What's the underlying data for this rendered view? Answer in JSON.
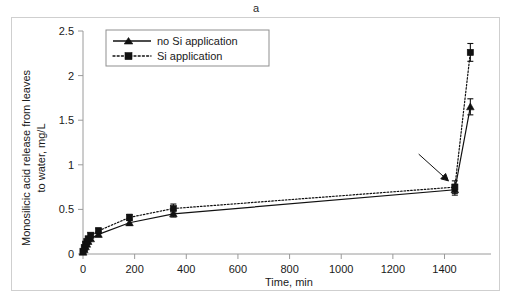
{
  "figure": {
    "panel_label": "a",
    "background_color": "#ffffff",
    "frame_color": "#cfcfcf",
    "ink_color": "#111111"
  },
  "chart_data": {
    "type": "line",
    "title": "a",
    "xlabel": "Time, min",
    "ylabel": "Monosilicic acid release from leaves to water, mg/L",
    "ylabel_line1": "Monosilicic acid release from leaves",
    "ylabel_line2": "to water, mg/L",
    "xlim": [
      0,
      1580
    ],
    "ylim": [
      0,
      2.5
    ],
    "xticks": [
      0,
      200,
      400,
      600,
      800,
      1000,
      1200,
      1400
    ],
    "xtick_labels": [
      "0",
      "200",
      "400",
      "600",
      "800",
      "1000",
      "1200",
      "1400"
    ],
    "yticks": [
      0,
      0.5,
      1,
      1.5,
      2,
      2.5
    ],
    "ytick_labels": [
      "0",
      "0.5",
      "1",
      "1.5",
      "2",
      "2.5"
    ],
    "grid": false,
    "legend_position": "top-left",
    "series": [
      {
        "name": "no Si application",
        "marker": "triangle",
        "linestyle": "solid",
        "color": "#111111",
        "x": [
          0,
          5,
          10,
          15,
          20,
          30,
          60,
          180,
          350,
          1440,
          1500
        ],
        "values": [
          0.02,
          0.05,
          0.08,
          0.11,
          0.14,
          0.17,
          0.22,
          0.35,
          0.45,
          0.72,
          1.65
        ],
        "yerr": [
          0.01,
          0.015,
          0.02,
          0.02,
          0.02,
          0.02,
          0.025,
          0.03,
          0.035,
          0.06,
          0.09
        ]
      },
      {
        "name": "Si application",
        "marker": "square",
        "linestyle": "dotted",
        "color": "#111111",
        "x": [
          0,
          5,
          10,
          15,
          20,
          30,
          60,
          180,
          350,
          1440,
          1500
        ],
        "values": [
          0.03,
          0.07,
          0.11,
          0.14,
          0.17,
          0.21,
          0.26,
          0.41,
          0.51,
          0.75,
          2.26
        ],
        "yerr": [
          0.012,
          0.018,
          0.02,
          0.02,
          0.025,
          0.025,
          0.03,
          0.035,
          0.05,
          0.07,
          0.1
        ]
      }
    ],
    "annotations": [
      {
        "name": "pointer-arrow",
        "type": "arrow",
        "text": "",
        "from_x": 1300,
        "from_y": 1.12,
        "to_x": 1415,
        "to_y": 0.82
      }
    ]
  }
}
